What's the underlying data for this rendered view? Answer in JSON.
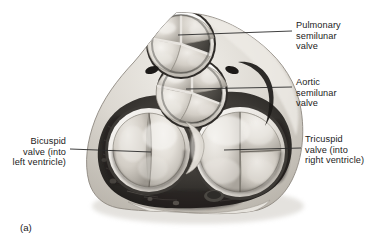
{
  "figure": {
    "caption": "(a)",
    "background_color": "#ffffff",
    "text_color": "#1b1b1b",
    "leader_color": "#2a2a2a"
  },
  "labels": [
    {
      "id": "pulmonary",
      "name": "pulmonary-semilunar-valve",
      "text": "Pulmonary\nsemilunar\nvalve",
      "side": "right",
      "text_x": 296,
      "text_y": 25,
      "leader": {
        "x1": 178,
        "y1": 35,
        "x2": 292,
        "y2": 31
      }
    },
    {
      "id": "aortic",
      "name": "aortic-semilunar-valve",
      "text": "Aortic\nsemilunar\nvalve",
      "side": "right",
      "text_x": 296,
      "text_y": 82,
      "leader": {
        "x1": 186,
        "y1": 89,
        "x2": 292,
        "y2": 87
      }
    },
    {
      "id": "bicuspid",
      "name": "bicuspid-valve",
      "text": "Bicuspid\nvalve (into\nleft ventricle)",
      "side": "left",
      "text_x": 8,
      "text_y": 140,
      "leader": {
        "x1": 151,
        "y1": 152,
        "x2": 70,
        "y2": 149
      }
    },
    {
      "id": "tricuspid",
      "name": "tricuspid-valve",
      "text": "Tricuspid\nvalve (into\nright ventricle)",
      "side": "right",
      "text_x": 305,
      "text_y": 139,
      "leader": {
        "x1": 224,
        "y1": 150,
        "x2": 301,
        "y2": 148
      }
    }
  ],
  "anatomy": {
    "pulmonary_valve": {
      "label": "pulmonary semilunar valve",
      "cusps": 3,
      "cx": 181,
      "cy": 44,
      "r": 33
    },
    "aortic_valve": {
      "label": "aortic semilunar valve",
      "cusps": 3,
      "cx": 192,
      "cy": 93,
      "r": 34
    },
    "bicuspid_valve": {
      "label": "bicuspid (mitral) valve",
      "leaflets": 2,
      "cx": 149,
      "cy": 150,
      "rx": 41,
      "ry": 42
    },
    "tricuspid_valve": {
      "label": "tricuspid valve",
      "leaflets": 3,
      "cx": 240,
      "cy": 152,
      "rx": 45,
      "ry": 45
    },
    "myocardium": {
      "label": "myocardium",
      "color": "#4a4a4a"
    },
    "fibrous_skeleton": {
      "label": "fibrous skeleton",
      "color": "#d8d5ce"
    },
    "coronary_ostium": {
      "label": "coronary sinus opening",
      "cx": 214,
      "cy": 196
    }
  }
}
